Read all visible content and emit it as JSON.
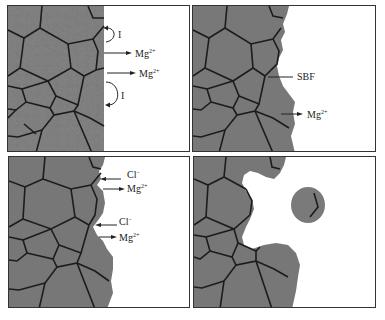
{
  "figure": {
    "panels": [
      {
        "id": "panel-1",
        "labels": [
          {
            "text": "I",
            "kind": "current-loop"
          },
          {
            "text": "Mg",
            "sup": "2+"
          },
          {
            "text": "Mg",
            "sup": "2+"
          },
          {
            "text": "I",
            "kind": "current-loop"
          }
        ]
      },
      {
        "id": "panel-2",
        "labels": [
          {
            "text": "SBF"
          },
          {
            "text": "Mg",
            "sup": "2+"
          }
        ]
      },
      {
        "id": "panel-3",
        "labels": [
          {
            "text": "Cl",
            "sup": "−"
          },
          {
            "text": "Mg",
            "sup": "2+"
          },
          {
            "text": "Cl",
            "sup": "−"
          },
          {
            "text": "Mg",
            "sup": "2+"
          }
        ]
      },
      {
        "id": "panel-4",
        "labels": []
      }
    ],
    "colors": {
      "grain_fill": "#7a7a7a",
      "grain_boundary": "#1e1e1e",
      "background": "#ffffff",
      "frame": "#333333"
    }
  }
}
